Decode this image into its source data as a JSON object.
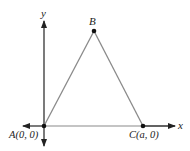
{
  "diagram": {
    "type": "coordinate-geometry",
    "axes": {
      "x_label": "x",
      "y_label": "y"
    },
    "points": [
      {
        "id": "A",
        "label": "A(0, 0)",
        "px": [
          44,
          126
        ]
      },
      {
        "id": "B",
        "label": "B",
        "px": [
          94,
          31
        ]
      },
      {
        "id": "C",
        "label": "C(a, 0)",
        "px": [
          143,
          126
        ]
      }
    ],
    "colors": {
      "axis": "#222222",
      "triangle": "#8a8a8a",
      "point": "#111111",
      "text": "#222222"
    }
  }
}
